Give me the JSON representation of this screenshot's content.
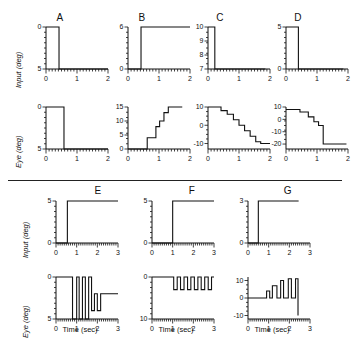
{
  "figure": {
    "axis_labels": {
      "input": "Input (deg)",
      "eye": "Eye (deg)",
      "time": "Time (sec)"
    },
    "panel_titles": [
      "A",
      "B",
      "C",
      "D",
      "E",
      "F",
      "G"
    ]
  },
  "chart_data": [
    {
      "id": "A-input",
      "type": "line",
      "title": "A",
      "xlabel": "",
      "ylabel": "Input (deg)",
      "xlim": [
        0,
        2
      ],
      "ylim": [
        5,
        0
      ],
      "xticks": [
        0,
        1,
        2
      ],
      "xticklabels": [
        "0",
        "1",
        "2"
      ],
      "yticks": [
        0,
        5
      ],
      "yticklabels": [
        "0",
        "5"
      ],
      "grid": false,
      "x": [
        0,
        0.42,
        0.42,
        2
      ],
      "y": [
        0,
        0,
        5,
        5
      ]
    },
    {
      "id": "A-eye",
      "type": "line",
      "title": "A",
      "xlabel": "",
      "ylabel": "Eye (deg)",
      "xlim": [
        0,
        2
      ],
      "ylim": [
        5,
        0
      ],
      "xticks": [
        0,
        1,
        2
      ],
      "xticklabels": [
        "0",
        "1",
        "2"
      ],
      "yticks": [
        0,
        5
      ],
      "yticklabels": [
        "0",
        "5"
      ],
      "grid": false,
      "x": [
        0,
        0.58,
        0.58,
        2
      ],
      "y": [
        0,
        0,
        5,
        5
      ]
    },
    {
      "id": "B-input",
      "type": "line",
      "title": "B",
      "xlabel": "",
      "ylabel": "Input (deg)",
      "xlim": [
        0,
        2
      ],
      "ylim": [
        0,
        6
      ],
      "xticks": [
        0,
        1,
        2
      ],
      "xticklabels": [
        "0",
        "1",
        "2"
      ],
      "yticks": [
        0,
        6
      ],
      "yticklabels": [
        "0",
        "6"
      ],
      "grid": false,
      "x": [
        0,
        0.42,
        0.42,
        2
      ],
      "y": [
        0,
        0,
        6,
        6
      ]
    },
    {
      "id": "B-eye",
      "type": "line",
      "title": "B",
      "xlabel": "",
      "ylabel": "Eye (deg)",
      "xlim": [
        0,
        2
      ],
      "ylim": [
        0,
        15
      ],
      "xticks": [
        0,
        1,
        2
      ],
      "xticklabels": [
        "0",
        "1",
        "2"
      ],
      "yticks": [
        0,
        5,
        10,
        15
      ],
      "yticklabels": [
        "0",
        "5",
        "10",
        "15"
      ],
      "grid": false,
      "x": [
        0,
        0.62,
        0.62,
        0.9,
        0.9,
        1.02,
        1.02,
        1.16,
        1.16,
        1.3,
        1.3,
        1.75
      ],
      "y": [
        0,
        0,
        4,
        4,
        8,
        8,
        10,
        10,
        13,
        13,
        15,
        15
      ]
    },
    {
      "id": "C-input",
      "type": "line",
      "title": "C",
      "xlabel": "",
      "ylabel": "Input (deg)",
      "xlim": [
        0,
        2
      ],
      "ylim": [
        7,
        10
      ],
      "xticks": [
        0,
        1,
        2
      ],
      "xticklabels": [
        "0",
        "1",
        "2"
      ],
      "yticks": [
        7,
        8,
        9,
        10
      ],
      "yticklabels": [
        "7",
        "8",
        "9",
        "10"
      ],
      "grid": false,
      "x": [
        0,
        0.22,
        0.22,
        1.85
      ],
      "y": [
        10,
        10,
        7,
        7
      ]
    },
    {
      "id": "C-eye",
      "type": "line",
      "title": "C",
      "xlabel": "",
      "ylabel": "Eye (deg)",
      "xlim": [
        0,
        2
      ],
      "ylim": [
        -13,
        10
      ],
      "xticks": [
        0,
        1,
        2
      ],
      "xticklabels": [
        "0",
        "1",
        "2"
      ],
      "yticks": [
        -10,
        0,
        10
      ],
      "yticklabels": [
        "-10",
        "0",
        "10"
      ],
      "grid": false,
      "x": [
        0,
        0.42,
        0.42,
        0.62,
        0.62,
        0.82,
        0.82,
        1.0,
        1.0,
        1.18,
        1.18,
        1.36,
        1.36,
        1.54,
        1.54,
        1.7,
        1.7,
        2.0
      ],
      "y": [
        10,
        10,
        8,
        8,
        6,
        6,
        3,
        3,
        0,
        0,
        -3,
        -3,
        -6,
        -6,
        -9,
        -9,
        -10,
        -10
      ]
    },
    {
      "id": "D-input",
      "type": "line",
      "title": "D",
      "xlabel": "",
      "ylabel": "Input (deg)",
      "xlim": [
        0,
        2
      ],
      "ylim": [
        0,
        5
      ],
      "xticks": [
        0,
        1,
        2
      ],
      "xticklabels": [
        "0",
        "1",
        "2"
      ],
      "yticks": [
        0,
        5
      ],
      "yticklabels": [
        "0",
        "5"
      ],
      "grid": false,
      "x": [
        0,
        0.4,
        0.4,
        1.85
      ],
      "y": [
        5,
        5,
        0,
        0
      ]
    },
    {
      "id": "D-eye",
      "type": "line",
      "title": "D",
      "xlabel": "",
      "ylabel": "Eye (deg)",
      "xlim": [
        0,
        2
      ],
      "ylim": [
        -24,
        10
      ],
      "xticks": [
        0,
        1,
        2
      ],
      "xticklabels": [
        "0",
        "1",
        "2"
      ],
      "yticks": [
        -20,
        -10,
        0,
        10
      ],
      "yticklabels": [
        "-20",
        "-10",
        "0",
        "10"
      ],
      "grid": false,
      "x": [
        0,
        0.45,
        0.45,
        0.72,
        0.72,
        0.9,
        0.9,
        1.05,
        1.05,
        1.2,
        1.2,
        1.32,
        1.32,
        1.95
      ],
      "y": [
        8,
        8,
        6,
        6,
        2,
        2,
        -2,
        -2,
        -5,
        -5,
        -20,
        -20,
        -20,
        -20
      ]
    },
    {
      "id": "E-input",
      "type": "line",
      "title": "E",
      "xlabel": "",
      "ylabel": "Input (deg)",
      "xlim": [
        0,
        3
      ],
      "ylim": [
        0,
        5
      ],
      "xticks": [
        0,
        1,
        2,
        3
      ],
      "xticklabels": [
        "0",
        "1",
        "2",
        "3"
      ],
      "yticks": [
        0,
        5
      ],
      "yticklabels": [
        "0",
        "5"
      ],
      "grid": false,
      "x": [
        0,
        0.55,
        0.55,
        3.0
      ],
      "y": [
        0,
        0,
        5,
        5
      ]
    },
    {
      "id": "E-eye",
      "type": "line",
      "title": "E",
      "xlabel": "Time (sec)",
      "ylabel": "Eye (deg)",
      "xlim": [
        0,
        3
      ],
      "ylim": [
        5,
        0
      ],
      "xticks": [
        0,
        1,
        2,
        3
      ],
      "xticklabels": [
        "0",
        "1",
        "2",
        "3"
      ],
      "yticks": [
        0,
        5
      ],
      "yticklabels": [
        "0",
        "5"
      ],
      "grid": false,
      "x": [
        0,
        0.8,
        0.8,
        1.0,
        1.0,
        1.12,
        1.12,
        1.28,
        1.28,
        1.42,
        1.42,
        1.58,
        1.58,
        1.72,
        1.72,
        1.86,
        1.86,
        2.0,
        2.0,
        2.16,
        2.16,
        3.0
      ],
      "y": [
        0,
        0,
        5,
        5,
        0,
        0,
        5,
        5,
        0,
        0,
        5,
        5,
        0,
        0,
        4,
        4,
        2,
        2,
        4,
        4,
        2,
        2
      ]
    },
    {
      "id": "F-input",
      "type": "line",
      "title": "F",
      "xlabel": "",
      "ylabel": "Input (deg)",
      "xlim": [
        0,
        3
      ],
      "ylim": [
        0,
        5
      ],
      "xticks": [
        0,
        1,
        2,
        3
      ],
      "xticklabels": [
        "0",
        "1",
        "2",
        "3"
      ],
      "yticks": [
        0,
        5
      ],
      "yticklabels": [
        "0",
        "5"
      ],
      "grid": false,
      "x": [
        0,
        1.0,
        1.0,
        3.0
      ],
      "y": [
        0,
        0,
        5,
        5
      ]
    },
    {
      "id": "F-eye",
      "type": "line",
      "title": "F",
      "xlabel": "Time (sec)",
      "ylabel": "Eye (deg)",
      "xlim": [
        0,
        3
      ],
      "ylim": [
        10,
        0
      ],
      "xticks": [
        0,
        1,
        2,
        3
      ],
      "xticklabels": [
        "0",
        "1",
        "2",
        "3"
      ],
      "yticks": [
        0,
        10
      ],
      "yticklabels": [
        "0",
        "10"
      ],
      "grid": false,
      "x": [
        0,
        1.05,
        1.05,
        1.22,
        1.22,
        1.38,
        1.38,
        1.55,
        1.55,
        1.72,
        1.72,
        1.88,
        1.88,
        2.05,
        2.05,
        2.22,
        2.22,
        2.38,
        2.38,
        2.55,
        2.55,
        2.72,
        2.72,
        2.88,
        2.88,
        3.0
      ],
      "y": [
        0,
        0,
        3,
        3,
        0,
        0,
        3,
        3,
        0,
        0,
        3,
        3,
        0,
        0,
        3,
        3,
        0,
        0,
        3,
        3,
        0,
        0,
        3,
        3,
        0,
        0
      ]
    },
    {
      "id": "G-input",
      "type": "line",
      "title": "G",
      "xlabel": "",
      "ylabel": "Input (deg)",
      "xlim": [
        0,
        3
      ],
      "ylim": [
        0,
        3
      ],
      "xticks": [
        0,
        1,
        2,
        3
      ],
      "xticklabels": [
        "0",
        "1",
        "2",
        "3"
      ],
      "yticks": [
        0,
        3
      ],
      "yticklabels": [
        "0",
        "3"
      ],
      "grid": false,
      "x": [
        0,
        0.5,
        0.5,
        2.45
      ],
      "y": [
        0,
        0,
        3,
        3
      ]
    },
    {
      "id": "G-eye",
      "type": "line",
      "title": "G",
      "xlabel": "Time (sec)",
      "ylabel": "Eye (deg)",
      "xlim": [
        0,
        3
      ],
      "ylim": [
        -12,
        12
      ],
      "xticks": [
        0,
        1,
        2,
        3
      ],
      "xticklabels": [
        "0",
        "1",
        "2",
        "3"
      ],
      "yticks": [
        -10,
        0,
        10
      ],
      "yticklabels": [
        "-10",
        "0",
        "10"
      ],
      "grid": false,
      "x": [
        0,
        0.9,
        0.9,
        1.05,
        1.05,
        1.18,
        1.18,
        1.4,
        1.4,
        1.58,
        1.58,
        1.72,
        1.72,
        1.95,
        1.95,
        2.1,
        2.1,
        2.3,
        2.3,
        2.42,
        2.42
      ],
      "y": [
        0,
        0,
        4,
        4,
        0,
        0,
        7,
        7,
        0,
        0,
        10,
        10,
        0,
        0,
        11,
        11,
        0,
        0,
        11,
        11,
        -10
      ]
    }
  ]
}
